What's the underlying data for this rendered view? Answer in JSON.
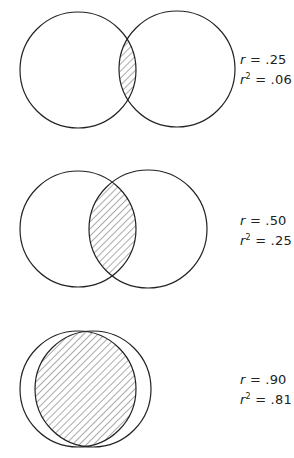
{
  "title": "",
  "colors": {
    "stroke": "#222222",
    "hatch": "#444444",
    "background": "#ffffff"
  },
  "panels": [
    {
      "id": "r25",
      "r_label": "r",
      "r_eq": " = ",
      "r_value": ".25",
      "r2_label": "r",
      "r2_sup": "2",
      "r2_eq": " = ",
      "r2_value": ".06",
      "circle_a": {
        "cx": 78,
        "cy": 70,
        "r": 58
      },
      "circle_b": {
        "cx": 177,
        "cy": 69,
        "r": 58
      },
      "label_pos": {
        "x": 240,
        "y1": 52,
        "y2": 72
      }
    },
    {
      "id": "r50",
      "r_label": "r",
      "r_eq": " = ",
      "r_value": ".50",
      "r2_label": "r",
      "r2_sup": "2",
      "r2_eq": " = ",
      "r2_value": ".25",
      "circle_a": {
        "cx": 78,
        "cy": 229,
        "r": 58
      },
      "circle_b": {
        "cx": 148,
        "cy": 229,
        "r": 59
      },
      "label_pos": {
        "x": 240,
        "y1": 213,
        "y2": 233
      }
    },
    {
      "id": "r90",
      "r_label": "r",
      "r_eq": " = ",
      "r_value": ".90",
      "r2_label": "r",
      "r2_sup": "2",
      "r2_eq": " = ",
      "r2_value": ".81",
      "circle_a": {
        "cx": 78,
        "cy": 389,
        "r": 58
      },
      "circle_b": {
        "cx": 93,
        "cy": 389,
        "r": 58
      },
      "label_pos": {
        "x": 240,
        "y1": 372,
        "y2": 392
      }
    }
  ]
}
